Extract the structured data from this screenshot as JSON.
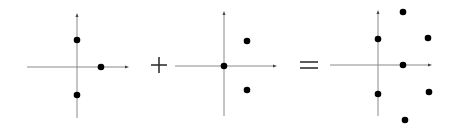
{
  "colors": {
    "axis": "#8a8a8a",
    "point": "#000000",
    "operator": "#333333",
    "background": "#ffffff"
  },
  "panels": [
    {
      "name": "panel-a",
      "x_axis": {
        "x1": 27,
        "x2": 127,
        "y": 67
      },
      "y_axis": {
        "x": 77,
        "y1": 15,
        "y2": 118
      },
      "points": [
        {
          "x": 77,
          "y": 40
        },
        {
          "x": 101,
          "y": 67
        },
        {
          "x": 77,
          "y": 95
        }
      ]
    },
    {
      "name": "panel-b",
      "x_axis": {
        "x1": 175,
        "x2": 275,
        "y": 66
      },
      "y_axis": {
        "x": 224,
        "y1": 13,
        "y2": 116
      },
      "points": [
        {
          "x": 224,
          "y": 66
        },
        {
          "x": 247,
          "y": 41
        },
        {
          "x": 247,
          "y": 90
        }
      ]
    },
    {
      "name": "panel-sum",
      "x_axis": {
        "x1": 330,
        "x2": 430,
        "y": 65
      },
      "y_axis": {
        "x": 378,
        "y1": 12,
        "y2": 116
      },
      "points": [
        {
          "x": 378,
          "y": 39
        },
        {
          "x": 378,
          "y": 94
        },
        {
          "x": 403,
          "y": 12
        },
        {
          "x": 403,
          "y": 65
        },
        {
          "x": 405,
          "y": 120
        },
        {
          "x": 428,
          "y": 38
        },
        {
          "x": 429,
          "y": 92
        }
      ]
    }
  ],
  "operators": [
    {
      "name": "plus-operator",
      "symbol": "+",
      "cx": 159,
      "cy": 65
    },
    {
      "name": "equals-operator",
      "symbol": "=",
      "cx": 309,
      "cy": 65
    }
  ]
}
